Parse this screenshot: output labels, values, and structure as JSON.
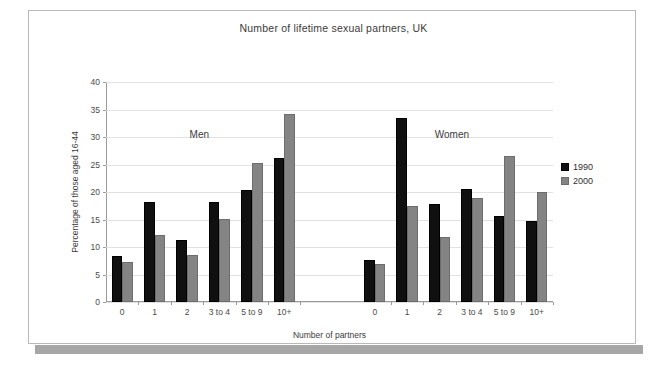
{
  "chart_data": {
    "type": "bar",
    "title": "Number of lifetime sexual partners, UK",
    "xlabel": "Number of partners",
    "ylabel": "Percentage of those aged 16-44",
    "ylim": [
      0,
      40
    ],
    "ytick_step": 5,
    "yticks": [
      "0",
      "5",
      "10",
      "15",
      "20",
      "25",
      "30",
      "35",
      "40"
    ],
    "grid": true,
    "legend_position": "right",
    "categories": [
      "0",
      "1",
      "2",
      "3 to 4",
      "5 to 9",
      "10+"
    ],
    "groups": [
      {
        "name": "Men",
        "series": [
          {
            "name": "1990",
            "color": "#101010",
            "values": [
              8.3,
              18.1,
              11.3,
              18.2,
              20.4,
              26.2
            ]
          },
          {
            "name": "2000",
            "color": "#848484",
            "values": [
              7.3,
              12.2,
              8.6,
              15.1,
              25.3,
              34.2
            ]
          }
        ]
      },
      {
        "name": "Women",
        "series": [
          {
            "name": "1990",
            "color": "#101010",
            "values": [
              7.7,
              33.5,
              17.8,
              20.6,
              15.6,
              14.8
            ]
          },
          {
            "name": "2000",
            "color": "#848484",
            "values": [
              6.9,
              17.5,
              11.9,
              19.0,
              26.5,
              20.0
            ]
          }
        ]
      }
    ],
    "legend": [
      {
        "label": "1990",
        "color": "#101010"
      },
      {
        "label": "2000",
        "color": "#848484"
      }
    ]
  }
}
